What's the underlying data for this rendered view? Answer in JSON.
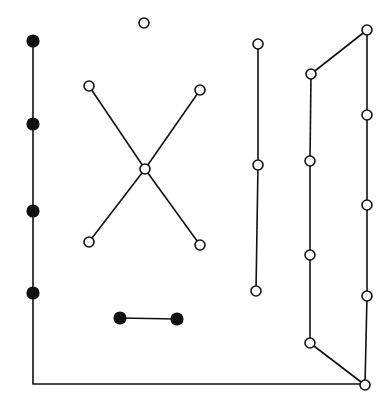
{
  "diagram": {
    "background": "#ffffff",
    "stroke_color": "#111111",
    "node_radius": 5,
    "nodes": [
      {
        "id": "f1",
        "x": 33,
        "y": 41,
        "filled": true
      },
      {
        "id": "f2",
        "x": 33,
        "y": 124,
        "filled": true
      },
      {
        "id": "f3",
        "x": 33,
        "y": 211,
        "filled": true
      },
      {
        "id": "f4",
        "x": 33,
        "y": 293,
        "filled": true
      },
      {
        "id": "b1",
        "x": 120,
        "y": 318,
        "filled": true
      },
      {
        "id": "b2",
        "x": 177,
        "y": 319,
        "filled": true
      },
      {
        "id": "iso",
        "x": 144,
        "y": 23,
        "filled": false
      },
      {
        "id": "xtl",
        "x": 89,
        "y": 86,
        "filled": false
      },
      {
        "id": "xtr",
        "x": 200,
        "y": 90,
        "filled": false
      },
      {
        "id": "xc",
        "x": 145,
        "y": 169,
        "filled": false
      },
      {
        "id": "xbl",
        "x": 89,
        "y": 242,
        "filled": false
      },
      {
        "id": "xbr",
        "x": 200,
        "y": 245,
        "filled": false
      },
      {
        "id": "m1",
        "x": 258,
        "y": 44,
        "filled": false
      },
      {
        "id": "m2",
        "x": 258,
        "y": 165,
        "filled": false
      },
      {
        "id": "m3",
        "x": 256,
        "y": 291,
        "filled": false
      },
      {
        "id": "l1",
        "x": 311,
        "y": 74,
        "filled": false
      },
      {
        "id": "l2",
        "x": 310,
        "y": 161,
        "filled": false
      },
      {
        "id": "l3",
        "x": 310,
        "y": 255,
        "filled": false
      },
      {
        "id": "l4",
        "x": 310,
        "y": 343,
        "filled": false
      },
      {
        "id": "r1",
        "x": 367,
        "y": 30,
        "filled": false
      },
      {
        "id": "r2",
        "x": 367,
        "y": 115,
        "filled": false
      },
      {
        "id": "r3",
        "x": 367,
        "y": 205,
        "filled": false
      },
      {
        "id": "r4",
        "x": 367,
        "y": 296,
        "filled": false
      },
      {
        "id": "r5",
        "x": 365,
        "y": 385,
        "filled": false
      }
    ],
    "edges": [
      [
        "f1",
        "f2"
      ],
      [
        "f2",
        "f3"
      ],
      [
        "f3",
        "f4"
      ],
      [
        "b1",
        "b2"
      ],
      [
        "xtl",
        "xc"
      ],
      [
        "xtr",
        "xc"
      ],
      [
        "xc",
        "xbl"
      ],
      [
        "xc",
        "xbr"
      ],
      [
        "m1",
        "m2"
      ],
      [
        "m2",
        "m3"
      ],
      [
        "l1",
        "l2"
      ],
      [
        "l2",
        "l3"
      ],
      [
        "l3",
        "l4"
      ],
      [
        "l4",
        "r5"
      ],
      [
        "l1",
        "r1"
      ],
      [
        "r1",
        "r2"
      ],
      [
        "r2",
        "r3"
      ],
      [
        "r3",
        "r4"
      ],
      [
        "r4",
        "r5"
      ]
    ],
    "polyline_edges": [
      {
        "id": "bottom-frame",
        "points": [
          [
            33,
            293
          ],
          [
            33,
            384
          ],
          [
            365,
            384
          ]
        ]
      }
    ]
  }
}
